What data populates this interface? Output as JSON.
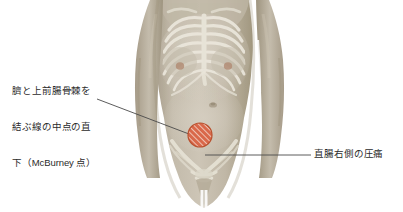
{
  "figure": {
    "type": "medical-illustration",
    "background_color": "#ffffff",
    "skin_color": "#bdb4a3",
    "skin_shadow_color": "#a89e8c",
    "skin_highlight_color": "#cfc7b8",
    "bone_color": "#e8e4d8",
    "marker": {
      "name": "mcburney-point-marker",
      "shape": "circle",
      "fill_color": "#d9684a",
      "hatch_color": "#ffffff",
      "stroke_color": "#b84a30",
      "center_x": 200,
      "center_y": 135,
      "radius": 12,
      "hatch_angle_deg": 45
    },
    "leader_lines": [
      {
        "name": "leader-line-mcburney",
        "x1": 97,
        "y1": 99,
        "x2": 189,
        "y2": 134,
        "color": "#4a4a4a"
      },
      {
        "name": "leader-line-rectal",
        "x1": 205,
        "y1": 155,
        "x2": 311,
        "y2": 155,
        "color": "#4a4a4a"
      }
    ]
  },
  "annotations": {
    "mcburney": {
      "name": "mcburney-point-label",
      "line1": "臍と上前腸骨棘を",
      "line2": "結ぶ線の中点の直",
      "line3": "下（McBurney 点）"
    },
    "rectal": {
      "name": "rectal-tenderness-label",
      "text": "直腸右側の圧痛"
    }
  }
}
